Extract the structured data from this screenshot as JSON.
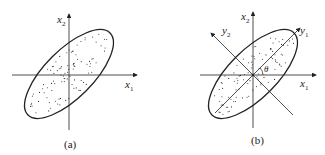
{
  "panels": [
    {
      "id": "a",
      "caption": "(a)",
      "axes": {
        "horizontal": {
          "var": "x",
          "sub": "1"
        },
        "vertical": {
          "var": "x",
          "sub": "2"
        }
      },
      "description": "Scatter of points inside an ellipse tilted ~45° relative to original x1-x2 axes"
    },
    {
      "id": "b",
      "caption": "(b)",
      "axes": {
        "horizontal": {
          "var": "x",
          "sub": "1"
        },
        "vertical": {
          "var": "x",
          "sub": "2"
        }
      },
      "rotated_axes": {
        "major": {
          "var": "y",
          "sub": "1"
        },
        "minor": {
          "var": "y",
          "sub": "2"
        }
      },
      "angle_label": "θ",
      "description": "Same ellipse with rotated principal axes y1 (major) and y2 (minor) at angle θ to x1"
    }
  ],
  "colors": {
    "line": "#222222",
    "dots": "#333333",
    "background": "#ffffff"
  }
}
